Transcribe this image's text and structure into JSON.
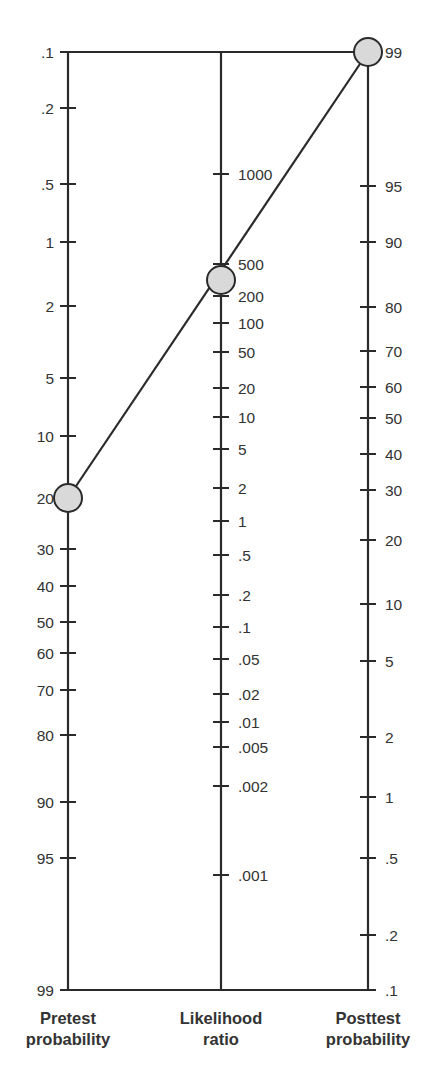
{
  "chart_data": {
    "type": "nomogram",
    "frame": {
      "top_y": 52,
      "bottom_y": 990
    },
    "axes": [
      {
        "id": "pretest",
        "title_lines": [
          "Pretest",
          "probability"
        ],
        "x": 68,
        "label_side": "left",
        "ticks": [
          {
            "label": ".1",
            "value": 0.1,
            "y": 52
          },
          {
            "label": ".2",
            "value": 0.2,
            "y": 108
          },
          {
            "label": ".5",
            "value": 0.5,
            "y": 184
          },
          {
            "label": "1",
            "value": 1,
            "y": 242
          },
          {
            "label": "2",
            "value": 2,
            "y": 306
          },
          {
            "label": "5",
            "value": 5,
            "y": 378
          },
          {
            "label": "10",
            "value": 10,
            "y": 436
          },
          {
            "label": "20",
            "value": 20,
            "y": 498
          },
          {
            "label": "30",
            "value": 30,
            "y": 549
          },
          {
            "label": "40",
            "value": 40,
            "y": 586
          },
          {
            "label": "50",
            "value": 50,
            "y": 622
          },
          {
            "label": "60",
            "value": 60,
            "y": 653
          },
          {
            "label": "70",
            "value": 70,
            "y": 690
          },
          {
            "label": "80",
            "value": 80,
            "y": 735
          },
          {
            "label": "90",
            "value": 90,
            "y": 802
          },
          {
            "label": "95",
            "value": 95,
            "y": 858
          },
          {
            "label": "99",
            "value": 99,
            "y": 990
          }
        ]
      },
      {
        "id": "likelihood",
        "title_lines": [
          "Likelihood",
          "ratio"
        ],
        "x": 221,
        "label_side": "right",
        "ticks": [
          {
            "label": "1000",
            "value": 1000,
            "y": 174
          },
          {
            "label": "500",
            "value": 500,
            "y": 264
          },
          {
            "label": "200",
            "value": 200,
            "y": 296
          },
          {
            "label": "100",
            "value": 100,
            "y": 323
          },
          {
            "label": "50",
            "value": 50,
            "y": 352
          },
          {
            "label": "20",
            "value": 20,
            "y": 388
          },
          {
            "label": "10",
            "value": 10,
            "y": 417
          },
          {
            "label": "5",
            "value": 5,
            "y": 449
          },
          {
            "label": "2",
            "value": 2,
            "y": 488
          },
          {
            "label": "1",
            "value": 1,
            "y": 521
          },
          {
            "label": ".5",
            "value": 0.5,
            "y": 555
          },
          {
            "label": ".2",
            "value": 0.2,
            "y": 595
          },
          {
            "label": ".1",
            "value": 0.1,
            "y": 627
          },
          {
            "label": ".05",
            "value": 0.05,
            "y": 659
          },
          {
            "label": ".02",
            "value": 0.02,
            "y": 694
          },
          {
            "label": ".01",
            "value": 0.01,
            "y": 722
          },
          {
            "label": ".005",
            "value": 0.005,
            "y": 747
          },
          {
            "label": ".002",
            "value": 0.002,
            "y": 786
          },
          {
            "label": ".001",
            "value": 0.001,
            "y": 875
          }
        ]
      },
      {
        "id": "posttest",
        "title_lines": [
          "Posttest",
          "probability"
        ],
        "x": 368,
        "label_side": "right",
        "ticks": [
          {
            "label": "99",
            "value": 99,
            "y": 52
          },
          {
            "label": "95",
            "value": 95,
            "y": 186
          },
          {
            "label": "90",
            "value": 90,
            "y": 242
          },
          {
            "label": "80",
            "value": 80,
            "y": 307
          },
          {
            "label": "70",
            "value": 70,
            "y": 351
          },
          {
            "label": "60",
            "value": 60,
            "y": 387
          },
          {
            "label": "50",
            "value": 50,
            "y": 418
          },
          {
            "label": "40",
            "value": 40,
            "y": 454
          },
          {
            "label": "30",
            "value": 30,
            "y": 490
          },
          {
            "label": "20",
            "value": 20,
            "y": 540
          },
          {
            "label": "10",
            "value": 10,
            "y": 604
          },
          {
            "label": "5",
            "value": 5,
            "y": 661
          },
          {
            "label": "2",
            "value": 2,
            "y": 737
          },
          {
            "label": "1",
            "value": 1,
            "y": 797
          },
          {
            "label": ".5",
            "value": 0.5,
            "y": 858
          },
          {
            "label": ".2",
            "value": 0.2,
            "y": 935
          },
          {
            "label": ".1",
            "value": 0.1,
            "y": 990
          }
        ]
      }
    ],
    "result_line": {
      "pretest_probability": 20,
      "likelihood_ratio": 350,
      "posttest_probability": 99,
      "points": [
        {
          "axis": "pretest",
          "x": 68,
          "y": 498
        },
        {
          "axis": "likelihood",
          "x": 221,
          "y": 280
        },
        {
          "axis": "posttest",
          "x": 368,
          "y": 52
        }
      ]
    },
    "colors": {
      "line": "#2a2a2a",
      "marker_fill": "#d9d9d9",
      "text": "#333333",
      "background": "#ffffff"
    }
  }
}
